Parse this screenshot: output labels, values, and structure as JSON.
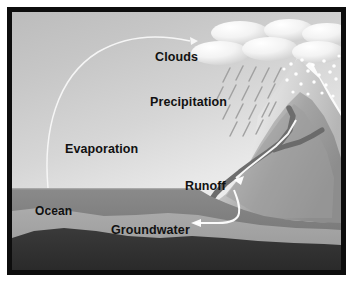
{
  "diagram": {
    "type": "water-cycle-illustration",
    "frame_color": "#0d0d0d",
    "background_color": "#ffffff"
  },
  "labels": {
    "clouds": "Clouds",
    "precipitation": "Precipitation",
    "evaporation": "Evaporation",
    "runoff": "Runoff",
    "ocean": "Ocean",
    "groundwater": "Groundwater"
  },
  "elements": {
    "clouds": {
      "name": "cloud-cluster",
      "count": 6,
      "color": "#f2f2f2",
      "description": "cluster of overlapping white ellipse puffs across the top right of the sky"
    },
    "precipitation_rain": {
      "name": "rain-streaks",
      "color": "#9a9a9a",
      "description": "short diagonal rain streaks slanting down-left beneath the clouds"
    },
    "precipitation_snow": {
      "name": "snow-dots",
      "color": "#ffffff",
      "description": "white dots falling over the snow-capped mountain peak"
    },
    "mountain": {
      "name": "mountain-range",
      "color": "#9c9c9c",
      "peak_color": "#ffffff",
      "description": "gray mountain slope on the right with a white snow-covered summit"
    },
    "river": {
      "name": "river-channel",
      "color": "#6e6e6e",
      "description": "dark Y-shaped branching river flowing down the mountain into the ocean"
    },
    "evaporation_arc": {
      "name": "evaporation-arrow",
      "color": "#f7f7f7",
      "description": "thin white arc rising from the ocean surface and curving to the clouds"
    },
    "runoff_arrow": {
      "name": "runoff-arrow",
      "color": "#ffffff",
      "description": "white arrow pointing down-left along the river toward the Runoff label"
    },
    "groundwater_arrow": {
      "name": "groundwater-arrow",
      "color": "#ffffff",
      "description": "white arrow descending from the shoreline then turning left into the groundwater layer"
    },
    "ocean": {
      "name": "ocean-body",
      "color": "#7e7e7e",
      "description": "medium gray ocean water filling the lower left"
    },
    "groundwater_layer": {
      "name": "groundwater-layer",
      "color": "#a2a2a2",
      "description": "lighter gray saturated sediment band beneath the ocean floor"
    },
    "bedrock": {
      "name": "bedrock-layer",
      "color": "#333333",
      "description": "dark gray bedrock forming the bottom of the scene"
    }
  }
}
